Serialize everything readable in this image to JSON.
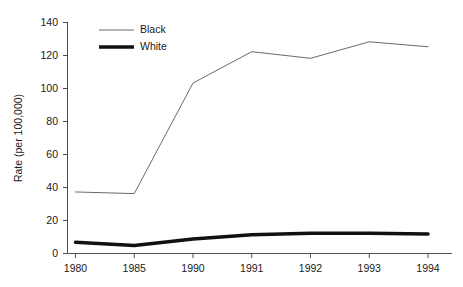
{
  "chart_data": {
    "type": "line",
    "title": "",
    "xlabel": "",
    "ylabel": "Rate (per 100,000)",
    "categories": [
      "1980",
      "1985",
      "1990",
      "1991",
      "1992",
      "1993",
      "1994"
    ],
    "ylim": [
      0,
      140
    ],
    "yticks": [
      0,
      20,
      40,
      60,
      80,
      100,
      120,
      140
    ],
    "ytick_labels": [
      "0",
      "20",
      "40",
      "60",
      "80",
      "100",
      "120",
      "140"
    ],
    "grid": false,
    "legend_position": "top-left-inside",
    "series": [
      {
        "name": "Black",
        "color": "#6a6a6a",
        "line_width": 1,
        "values": [
          37,
          36,
          103,
          122,
          118,
          128,
          125
        ]
      },
      {
        "name": "White",
        "color": "#111111",
        "line_width": 3.5,
        "values": [
          6.5,
          4.5,
          8.5,
          11,
          12,
          12,
          11.5
        ]
      }
    ]
  },
  "axes": {
    "y_axis_title": "Rate (per 100,000)"
  },
  "legend": {
    "entries": [
      {
        "label": "Black"
      },
      {
        "label": "White"
      }
    ]
  }
}
